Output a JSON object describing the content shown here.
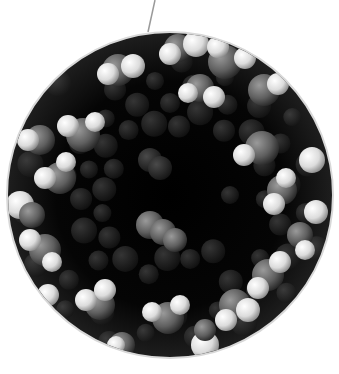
{
  "figure": {
    "background": "#ffffff",
    "inset": {
      "cx": 170,
      "cy": 195,
      "r": 163,
      "border": "#d8d8d8",
      "fill": "#050505"
    },
    "leader_line": {
      "x1": 155,
      "y1": 0,
      "x2": 148,
      "y2": 32,
      "color": "#9a9a9a"
    },
    "colors": {
      "heavy_atom": "#6e6e6e",
      "hydrogen": "#f2f2f2",
      "cavity": "#000000"
    },
    "molecules": [
      [
        118,
        70,
        16,
        "h"
      ],
      [
        133,
        66,
        12,
        "w"
      ],
      [
        108,
        74,
        11,
        "w"
      ],
      [
        178,
        48,
        14,
        "h"
      ],
      [
        196,
        44,
        13,
        "w"
      ],
      [
        170,
        54,
        11,
        "w"
      ],
      [
        225,
        62,
        17,
        "h"
      ],
      [
        218,
        47,
        11,
        "w"
      ],
      [
        245,
        58,
        11,
        "w"
      ],
      [
        200,
        88,
        14,
        "h"
      ],
      [
        188,
        93,
        10,
        "w"
      ],
      [
        214,
        97,
        11,
        "w"
      ],
      [
        264,
        90,
        16,
        "h"
      ],
      [
        278,
        84,
        11,
        "w"
      ],
      [
        83,
        135,
        17,
        "h"
      ],
      [
        68,
        126,
        11,
        "w"
      ],
      [
        95,
        122,
        10,
        "w"
      ],
      [
        40,
        140,
        15,
        "h"
      ],
      [
        28,
        140,
        11,
        "w"
      ],
      [
        60,
        178,
        16,
        "h"
      ],
      [
        45,
        178,
        11,
        "w"
      ],
      [
        66,
        162,
        10,
        "w"
      ],
      [
        262,
        148,
        17,
        "h"
      ],
      [
        244,
        155,
        11,
        "w"
      ],
      [
        282,
        190,
        15,
        "h"
      ],
      [
        274,
        204,
        11,
        "w"
      ],
      [
        286,
        178,
        10,
        "w"
      ],
      [
        312,
        160,
        13,
        "w"
      ],
      [
        316,
        212,
        12,
        "w"
      ],
      [
        20,
        205,
        14,
        "w"
      ],
      [
        32,
        215,
        13,
        "h"
      ],
      [
        45,
        250,
        16,
        "h"
      ],
      [
        30,
        240,
        11,
        "w"
      ],
      [
        52,
        262,
        10,
        "w"
      ],
      [
        150,
        225,
        14,
        "h"
      ],
      [
        163,
        232,
        13,
        "h"
      ],
      [
        175,
        240,
        12,
        "h"
      ],
      [
        150,
        160,
        12,
        "m"
      ],
      [
        160,
        168,
        12,
        "m"
      ],
      [
        268,
        275,
        16,
        "h"
      ],
      [
        258,
        288,
        11,
        "w"
      ],
      [
        280,
        262,
        11,
        "w"
      ],
      [
        235,
        305,
        16,
        "h"
      ],
      [
        248,
        310,
        12,
        "w"
      ],
      [
        226,
        320,
        11,
        "w"
      ],
      [
        168,
        318,
        16,
        "h"
      ],
      [
        152,
        312,
        10,
        "w"
      ],
      [
        180,
        305,
        10,
        "w"
      ],
      [
        100,
        305,
        15,
        "h"
      ],
      [
        86,
        300,
        11,
        "w"
      ],
      [
        105,
        290,
        11,
        "w"
      ],
      [
        48,
        295,
        11,
        "w"
      ],
      [
        122,
        345,
        13,
        "h"
      ],
      [
        116,
        345,
        9,
        "w"
      ],
      [
        205,
        345,
        14,
        "w"
      ],
      [
        205,
        330,
        11,
        "h"
      ],
      [
        300,
        235,
        13,
        "h"
      ],
      [
        305,
        250,
        10,
        "w"
      ]
    ]
  }
}
